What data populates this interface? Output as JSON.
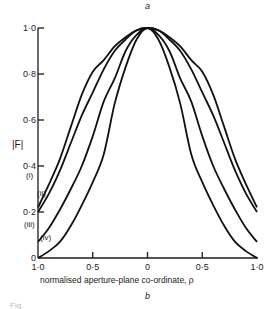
{
  "panel_top_label": "a",
  "panel_bottom_label": "b",
  "figure_caption_fragment": "Fig.",
  "chart_data": {
    "type": "line",
    "title": "",
    "xlabel": "normalised aperture-plane co-ordinate, ρ",
    "ylabel": "|F|",
    "xlim": [
      -1.0,
      1.0
    ],
    "ylim": [
      0,
      1.0
    ],
    "grid": false,
    "legend_position": "inline labels at left ends of curves",
    "x_tick_labels": [
      "1·0",
      "0·5",
      "0",
      "0·5",
      "1·0"
    ],
    "x_ticks": [
      -1.0,
      -0.5,
      0,
      0.5,
      1.0
    ],
    "y_tick_labels": [
      "0",
      "0·2",
      "0·4",
      "0·6",
      "0·8",
      "1·0"
    ],
    "y_ticks": [
      0,
      0.2,
      0.4,
      0.6,
      0.8,
      1.0
    ],
    "x": [
      -1.0,
      -0.9,
      -0.8,
      -0.7,
      -0.6,
      -0.5,
      -0.4,
      -0.3,
      -0.2,
      -0.1,
      0,
      0.1,
      0.2,
      0.3,
      0.4,
      0.5,
      0.6,
      0.7,
      0.8,
      0.9,
      1.0
    ],
    "series": [
      {
        "name": "(i)",
        "values": [
          0.22,
          0.32,
          0.43,
          0.57,
          0.71,
          0.81,
          0.86,
          0.92,
          0.96,
          0.99,
          1.0,
          0.99,
          0.96,
          0.92,
          0.86,
          0.81,
          0.71,
          0.57,
          0.43,
          0.32,
          0.22
        ]
      },
      {
        "name": "(ii)",
        "values": [
          0.2,
          0.28,
          0.38,
          0.5,
          0.62,
          0.72,
          0.82,
          0.9,
          0.95,
          0.99,
          1.0,
          0.99,
          0.95,
          0.9,
          0.82,
          0.72,
          0.62,
          0.5,
          0.38,
          0.28,
          0.2
        ]
      },
      {
        "name": "(iii)",
        "values": [
          0.07,
          0.13,
          0.21,
          0.3,
          0.4,
          0.53,
          0.68,
          0.78,
          0.9,
          0.97,
          1.0,
          0.97,
          0.9,
          0.78,
          0.68,
          0.53,
          0.4,
          0.3,
          0.21,
          0.13,
          0.07
        ]
      },
      {
        "name": "(iv)",
        "values": [
          0.0,
          0.03,
          0.07,
          0.14,
          0.23,
          0.33,
          0.45,
          0.67,
          0.83,
          0.95,
          1.0,
          0.95,
          0.83,
          0.67,
          0.45,
          0.33,
          0.23,
          0.14,
          0.07,
          0.03,
          0.0
        ]
      }
    ],
    "curve_label_positions": [
      {
        "name": "(i)",
        "x": 26,
        "y": 178
      },
      {
        "name": "(ii)",
        "x": 37,
        "y": 196
      },
      {
        "name": "(iii)",
        "x": 24,
        "y": 227
      },
      {
        "name": "(iv)",
        "x": 40,
        "y": 240
      }
    ]
  }
}
